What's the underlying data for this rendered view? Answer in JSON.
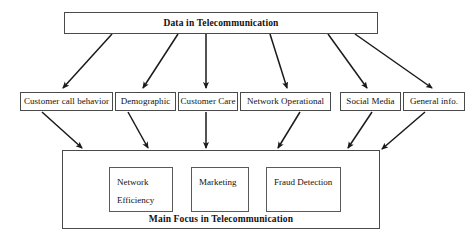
{
  "diagram": {
    "title": "Data in Telecommunication",
    "root": {
      "label": "Data in Telecommunication"
    },
    "categories": [
      {
        "label": "Customer call behavior"
      },
      {
        "label": "Demographic"
      },
      {
        "label": "Customer Care"
      },
      {
        "label": "Network Operational"
      },
      {
        "label": "Social Media"
      },
      {
        "label": "General info."
      }
    ],
    "focus": {
      "caption": "Main Focus in Telecommunication",
      "items": [
        {
          "line1": "Network",
          "line2": "Efficiency"
        },
        {
          "line1": "Marketing",
          "line2": ""
        },
        {
          "line1": "Fraud Detection",
          "line2": ""
        }
      ]
    },
    "style": {
      "background": "#ffffff",
      "border": "#4a4a4a",
      "text": "#111111",
      "arrow": "#1a1a1a"
    }
  }
}
